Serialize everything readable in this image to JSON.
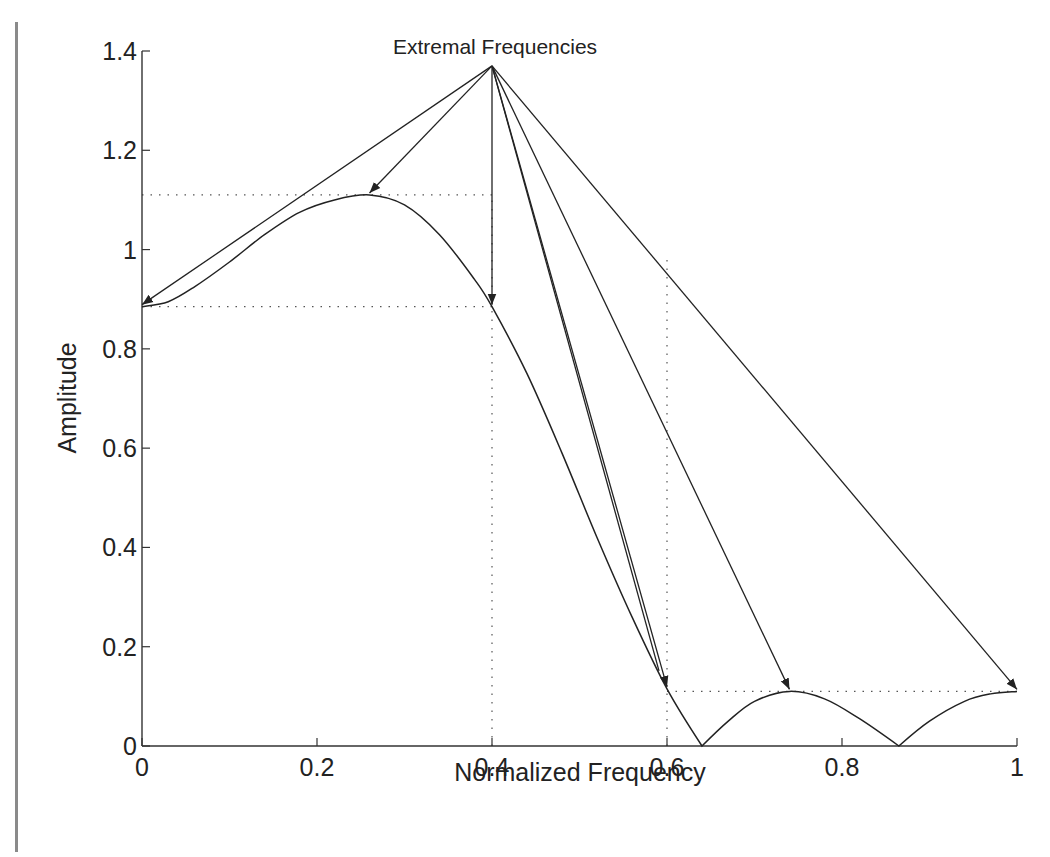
{
  "chart_data": {
    "type": "line",
    "title": "",
    "xlabel": "Normalized Frequency",
    "ylabel": "Amplitude",
    "xlim": [
      0,
      1
    ],
    "ylim": [
      0,
      1.4
    ],
    "xticks": [
      "0",
      "0.2",
      "0.4",
      "0.6",
      "0.8",
      "1"
    ],
    "xtick_values": [
      0,
      0.2,
      0.4,
      0.6,
      0.8,
      1
    ],
    "yticks": [
      "0",
      "0.2",
      "0.4",
      "0.6",
      "0.8",
      "1",
      "1.2",
      "1.4"
    ],
    "ytick_values": [
      0,
      0.2,
      0.4,
      0.6,
      0.8,
      1,
      1.2,
      1.4
    ],
    "grid": false,
    "series": [
      {
        "name": "Amplitude response",
        "x": [
          0,
          0.03,
          0.06,
          0.1,
          0.14,
          0.18,
          0.22,
          0.26,
          0.3,
          0.34,
          0.38,
          0.4,
          0.44,
          0.48,
          0.52,
          0.56,
          0.6,
          0.64,
          0.67,
          0.7,
          0.74,
          0.78,
          0.82,
          0.865,
          0.9,
          0.94,
          0.97,
          1.0
        ],
        "y": [
          0.885,
          0.895,
          0.925,
          0.975,
          1.03,
          1.075,
          1.1,
          1.11,
          1.09,
          1.03,
          0.94,
          0.885,
          0.75,
          0.59,
          0.42,
          0.26,
          0.115,
          0.0,
          0.05,
          0.09,
          0.11,
          0.095,
          0.055,
          0.0,
          0.05,
          0.09,
          0.105,
          0.11
        ]
      }
    ],
    "reference_lines": {
      "horizontal_dotted": [
        {
          "y": 1.11,
          "x_from": 0,
          "x_to": 0.4
        },
        {
          "y": 0.885,
          "x_from": 0,
          "x_to": 0.4
        },
        {
          "y": 0.11,
          "x_from": 0.6,
          "x_to": 1.0
        }
      ],
      "vertical_dotted": [
        {
          "x": 0.4,
          "y_from": 0,
          "y_to": 1.11
        },
        {
          "x": 0.6,
          "y_from": 0,
          "y_to": 0.98
        }
      ]
    },
    "annotations": [
      {
        "text": "Extremal Frequencies",
        "apex": {
          "x": 0.4,
          "y": 1.37
        },
        "arrow_targets": [
          {
            "x": 0.0,
            "y": 0.885
          },
          {
            "x": 0.26,
            "y": 1.11
          },
          {
            "x": 0.4,
            "y": 0.885
          },
          {
            "x": 0.6,
            "y": 0.115
          },
          {
            "x": 0.74,
            "y": 0.11
          },
          {
            "x": 1.0,
            "y": 0.11
          }
        ],
        "extra_lines_to": [
          {
            "x": 0.6,
            "y": 0.115
          }
        ]
      }
    ]
  }
}
